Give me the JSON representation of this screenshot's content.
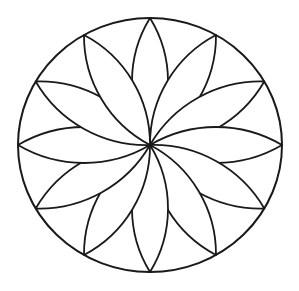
{
  "figure": {
    "background": "#ffffff",
    "line_color": "#1a1a1a",
    "center": [
      150,
      145
    ],
    "rim_radius_x": 132,
    "rim_radius_y": 127,
    "petal_count": 12,
    "petal_angle_step_deg": 30,
    "petal_half_width": 18
  }
}
